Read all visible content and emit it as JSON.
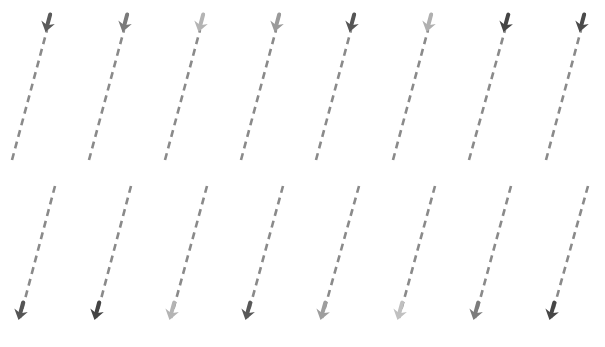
{
  "diagram": {
    "background": "#ffffff",
    "dash_color": "#8a8a8a",
    "top_row": [
      {
        "line": [
          12,
          160,
          47,
          30
        ],
        "arrow_tip": [
          46,
          30
        ],
        "direction": "down",
        "color": "#5a5a5a"
      },
      {
        "line": [
          89,
          160,
          124,
          30
        ],
        "arrow_tip": [
          123,
          30
        ],
        "direction": "down",
        "color": "#7a7a7a"
      },
      {
        "line": [
          165,
          160,
          200,
          30
        ],
        "arrow_tip": [
          199,
          30
        ],
        "direction": "down",
        "color": "#b4b4b4"
      },
      {
        "line": [
          241,
          160,
          276,
          30
        ],
        "arrow_tip": [
          275,
          30
        ],
        "direction": "down",
        "color": "#9a9a9a"
      },
      {
        "line": [
          316,
          160,
          351,
          30
        ],
        "arrow_tip": [
          350,
          30
        ],
        "direction": "down",
        "color": "#555555"
      },
      {
        "line": [
          393,
          160,
          428,
          30
        ],
        "arrow_tip": [
          427,
          30
        ],
        "direction": "down",
        "color": "#b0b0b0"
      },
      {
        "line": [
          469,
          160,
          505,
          30
        ],
        "arrow_tip": [
          504,
          30
        ],
        "direction": "down",
        "color": "#444444"
      },
      {
        "line": [
          546,
          160,
          581,
          30
        ],
        "arrow_tip": [
          580,
          30
        ],
        "direction": "down",
        "color": "#4a4a4a"
      }
    ],
    "bottom_row": [
      {
        "line": [
          55,
          186,
          20,
          318
        ],
        "arrow_tip": [
          19,
          318
        ],
        "direction": "up",
        "color": "#555555"
      },
      {
        "line": [
          131,
          186,
          96,
          318
        ],
        "arrow_tip": [
          95,
          318
        ],
        "direction": "up",
        "color": "#444444"
      },
      {
        "line": [
          207,
          186,
          171,
          318
        ],
        "arrow_tip": [
          170,
          318
        ],
        "direction": "up",
        "color": "#b4b4b4"
      },
      {
        "line": [
          283,
          186,
          247,
          318
        ],
        "arrow_tip": [
          246,
          318
        ],
        "direction": "up",
        "color": "#585858"
      },
      {
        "line": [
          359,
          186,
          322,
          318
        ],
        "arrow_tip": [
          321,
          318
        ],
        "direction": "up",
        "color": "#9e9e9e"
      },
      {
        "line": [
          435,
          186,
          399,
          318
        ],
        "arrow_tip": [
          398,
          318
        ],
        "direction": "up",
        "color": "#c0c0c0"
      },
      {
        "line": [
          511,
          186,
          475,
          318
        ],
        "arrow_tip": [
          474,
          318
        ],
        "direction": "up",
        "color": "#7c7c7c"
      },
      {
        "line": [
          588,
          186,
          551,
          318
        ],
        "arrow_tip": [
          550,
          318
        ],
        "direction": "up",
        "color": "#464646"
      }
    ]
  }
}
